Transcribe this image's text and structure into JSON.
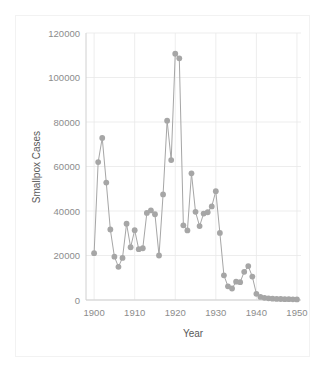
{
  "chart_data": {
    "type": "line",
    "title": "",
    "xlabel": "Year",
    "ylabel": "Smallpox Cases",
    "xlim": [
      1898,
      1951
    ],
    "ylim": [
      0,
      120000
    ],
    "xticks": [
      "1900",
      "1910",
      "1920",
      "1930",
      "1940",
      "1950"
    ],
    "xtick_values": [
      1900,
      1910,
      1920,
      1930,
      1940,
      1950
    ],
    "yticks": [
      "0",
      "20000",
      "40000",
      "60000",
      "80000",
      "100000",
      "120000"
    ],
    "ytick_values": [
      0,
      20000,
      40000,
      60000,
      80000,
      100000,
      120000
    ],
    "grid": "horizontal-and-vertical",
    "legend": "none",
    "marker": "circle",
    "series_color": "#a6a6a6",
    "x": [
      1900,
      1901,
      1902,
      1903,
      1904,
      1905,
      1906,
      1907,
      1908,
      1909,
      1910,
      1911,
      1912,
      1913,
      1914,
      1915,
      1916,
      1917,
      1918,
      1919,
      1920,
      1921,
      1922,
      1923,
      1924,
      1925,
      1926,
      1927,
      1928,
      1929,
      1930,
      1931,
      1932,
      1933,
      1934,
      1935,
      1936,
      1937,
      1938,
      1939,
      1940,
      1941,
      1942,
      1943,
      1944,
      1945,
      1946,
      1947,
      1948,
      1949,
      1950
    ],
    "values": [
      21064,
      61974,
      72849,
      52795,
      31694,
      19459,
      14931,
      18927,
      34260,
      23700,
      31403,
      22838,
      23269,
      39121,
      40262,
      38544,
      19999,
      47470,
      80578,
      62870,
      110672,
      108602,
      33567,
      31254,
      56913,
      39618,
      33222,
      38859,
      39434,
      42057,
      48907,
      30151,
      11073,
      6142,
      5160,
      8221,
      8012,
      12678,
      15238,
      10524,
      2795,
      1399,
      995,
      760,
      588,
      502,
      440,
      390,
      350,
      315,
      280
    ],
    "data_note": "US Smallpox reported cases 1900-1950"
  },
  "clipped_title_fragment": ""
}
